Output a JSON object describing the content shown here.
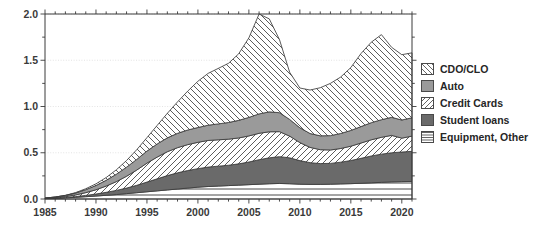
{
  "chart_data": {
    "type": "area",
    "title": "",
    "xlabel": "",
    "ylabel": "",
    "stacked": true,
    "grid": true,
    "legend_position": "right",
    "xlim": [
      1985,
      2021
    ],
    "ylim": [
      0.0,
      2.0
    ],
    "ytick_labels": [
      "0.0",
      "0.5",
      "1.0",
      "1.5",
      "2.0"
    ],
    "ytick_values": [
      0.0,
      0.5,
      1.0,
      1.5,
      2.0
    ],
    "yminor_step": 0.25,
    "xtick_labels": [
      "1985",
      "1990",
      "1995",
      "2000",
      "2005",
      "2010",
      "2015",
      "2020"
    ],
    "xtick_values": [
      1985,
      1990,
      1995,
      2000,
      2005,
      2010,
      2015,
      2020
    ],
    "x": [
      1985,
      1986,
      1987,
      1988,
      1989,
      1990,
      1991,
      1992,
      1993,
      1994,
      1995,
      1996,
      1997,
      1998,
      1999,
      2000,
      2001,
      2002,
      2003,
      2004,
      2005,
      2006,
      2007,
      2008,
      2009,
      2010,
      2011,
      2012,
      2013,
      2014,
      2015,
      2016,
      2017,
      2018,
      2019,
      2020,
      2021
    ],
    "series": [
      {
        "name": "Equipment, Other",
        "pattern": "horizontal-lines",
        "color": "#ffffff",
        "values": [
          0.005,
          0.008,
          0.012,
          0.018,
          0.025,
          0.032,
          0.04,
          0.048,
          0.058,
          0.068,
          0.078,
          0.088,
          0.098,
          0.108,
          0.118,
          0.128,
          0.135,
          0.14,
          0.145,
          0.15,
          0.155,
          0.16,
          0.165,
          0.168,
          0.165,
          0.16,
          0.158,
          0.158,
          0.16,
          0.163,
          0.166,
          0.17,
          0.175,
          0.18,
          0.185,
          0.188,
          0.19
        ]
      },
      {
        "name": "Student loans",
        "pattern": "solid",
        "color": "#6a6a6a",
        "values": [
          0.0,
          0.002,
          0.004,
          0.008,
          0.014,
          0.022,
          0.032,
          0.045,
          0.06,
          0.08,
          0.105,
          0.13,
          0.155,
          0.175,
          0.19,
          0.2,
          0.21,
          0.215,
          0.22,
          0.23,
          0.245,
          0.265,
          0.28,
          0.29,
          0.28,
          0.255,
          0.235,
          0.225,
          0.225,
          0.235,
          0.25,
          0.27,
          0.29,
          0.305,
          0.315,
          0.32,
          0.325
        ]
      },
      {
        "name": "Credit Cards",
        "pattern": "forward-hatch",
        "color": "#ffffff",
        "values": [
          0.002,
          0.005,
          0.01,
          0.018,
          0.03,
          0.046,
          0.068,
          0.095,
          0.128,
          0.165,
          0.205,
          0.235,
          0.258,
          0.272,
          0.28,
          0.285,
          0.288,
          0.285,
          0.282,
          0.28,
          0.282,
          0.285,
          0.282,
          0.27,
          0.235,
          0.195,
          0.165,
          0.15,
          0.145,
          0.148,
          0.155,
          0.165,
          0.175,
          0.182,
          0.188,
          0.15,
          0.165
        ]
      },
      {
        "name": "Auto",
        "pattern": "solid",
        "color": "#9a9a9a",
        "values": [
          0.003,
          0.006,
          0.012,
          0.02,
          0.032,
          0.046,
          0.062,
          0.08,
          0.098,
          0.115,
          0.13,
          0.142,
          0.15,
          0.155,
          0.158,
          0.16,
          0.165,
          0.172,
          0.18,
          0.19,
          0.2,
          0.21,
          0.215,
          0.205,
          0.18,
          0.16,
          0.15,
          0.15,
          0.155,
          0.162,
          0.17,
          0.178,
          0.185,
          0.19,
          0.195,
          0.196,
          0.198
        ]
      },
      {
        "name": "CDO/CLO",
        "pattern": "back-hatch",
        "color": "#ffffff",
        "values": [
          0.0,
          0.0,
          0.002,
          0.005,
          0.01,
          0.018,
          0.03,
          0.048,
          0.072,
          0.105,
          0.145,
          0.2,
          0.265,
          0.34,
          0.42,
          0.5,
          0.56,
          0.6,
          0.64,
          0.72,
          0.86,
          1.08,
          1.005,
          0.79,
          0.51,
          0.43,
          0.47,
          0.52,
          0.565,
          0.61,
          0.68,
          0.79,
          0.87,
          0.92,
          0.757,
          0.706,
          0.702
        ]
      }
    ],
    "totals": [
      0.01,
      0.021,
      0.04,
      0.069,
      0.111,
      0.164,
      0.232,
      0.316,
      0.416,
      0.533,
      0.663,
      0.795,
      0.926,
      1.05,
      1.166,
      1.273,
      1.358,
      1.412,
      1.467,
      1.57,
      1.742,
      2.0,
      1.947,
      1.723,
      1.37,
      1.2,
      1.178,
      1.203,
      1.25,
      1.318,
      1.421,
      1.573,
      1.695,
      1.777,
      1.64,
      1.56,
      1.58
    ]
  },
  "legend": {
    "items": [
      {
        "label": "CDO/CLO"
      },
      {
        "label": "Auto"
      },
      {
        "label": "Credit Cards"
      },
      {
        "label": "Student loans"
      },
      {
        "label": "Equipment, Other"
      }
    ]
  }
}
